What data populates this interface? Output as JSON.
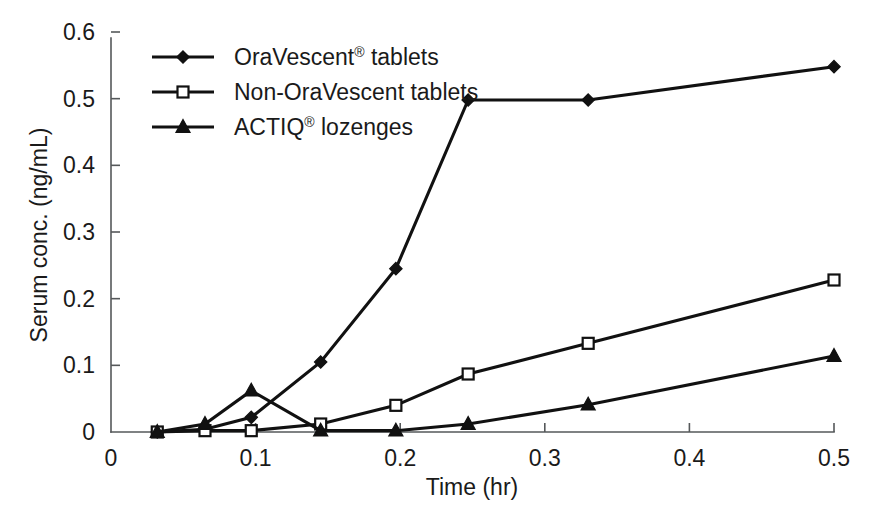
{
  "chart_data": {
    "type": "line",
    "title": "",
    "xlabel": "Time (hr)",
    "ylabel": "Serum conc. (ng/mL)",
    "xlim": [
      0,
      0.5
    ],
    "ylim": [
      0,
      0.6
    ],
    "xticks": [
      0,
      0.1,
      0.2,
      0.3,
      0.4,
      0.5
    ],
    "xtick_labels": [
      "0",
      "0.1",
      "0.2",
      "0.3",
      "0.4",
      "0.5"
    ],
    "yticks": [
      0,
      0.1,
      0.2,
      0.3,
      0.4,
      0.5,
      0.6
    ],
    "ytick_labels": [
      "0",
      "0.1",
      "0.2",
      "0.3",
      "0.4",
      "0.5",
      "0.6"
    ],
    "grid": false,
    "legend_position": "upper-left-inside",
    "series": [
      {
        "name": "OraVescent® tablets",
        "name_base": "OraVescent",
        "name_sup": "®",
        "name_tail": " tablets",
        "marker": "filled-diamond",
        "x": [
          0.032,
          0.065,
          0.097,
          0.145,
          0.197,
          0.247,
          0.33,
          0.5
        ],
        "y": [
          0.0,
          0.004,
          0.022,
          0.105,
          0.245,
          0.498,
          0.498,
          0.548
        ]
      },
      {
        "name": "Non-OraVescent tablets",
        "name_base": "Non-OraVescent tablets",
        "name_sup": "",
        "name_tail": "",
        "marker": "open-square",
        "x": [
          0.032,
          0.065,
          0.097,
          0.145,
          0.197,
          0.247,
          0.33,
          0.5
        ],
        "y": [
          0.0,
          0.002,
          0.002,
          0.012,
          0.04,
          0.087,
          0.133,
          0.228
        ]
      },
      {
        "name": "ACTIQ® lozenges",
        "name_base": "ACTIQ",
        "name_sup": "®",
        "name_tail": " lozenges",
        "marker": "filled-triangle",
        "x": [
          0.032,
          0.065,
          0.097,
          0.145,
          0.197,
          0.247,
          0.33,
          0.5
        ],
        "y": [
          0.0,
          0.012,
          0.062,
          0.002,
          0.002,
          0.012,
          0.041,
          0.114
        ]
      }
    ]
  },
  "axes": {
    "x_title": "Time (hr)",
    "y_title": "Serum conc. (ng/mL)"
  },
  "legend": {
    "items": [
      {
        "label": "OraVescent® tablets",
        "base": "OraVescent",
        "sup": "®",
        "tail": " tablets",
        "marker": "filled-diamond"
      },
      {
        "label": "Non-OraVescent tablets",
        "base": "Non-OraVescent tablets",
        "sup": "",
        "tail": "",
        "marker": "open-square"
      },
      {
        "label": "ACTIQ® lozenges",
        "base": "ACTIQ",
        "sup": "®",
        "tail": " lozenges",
        "marker": "filled-triangle"
      }
    ]
  },
  "colors": {
    "ink": "#111111",
    "axis": "#55585a",
    "background": "#ffffff"
  }
}
